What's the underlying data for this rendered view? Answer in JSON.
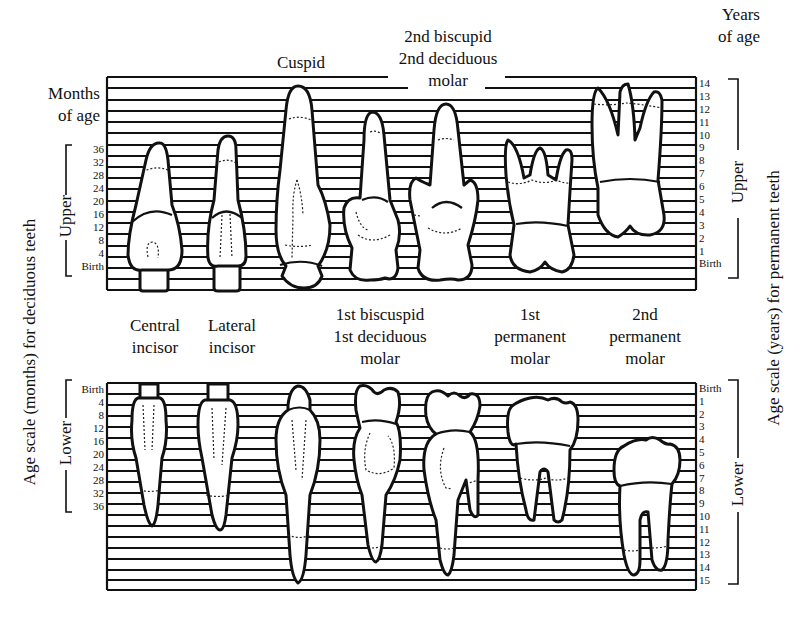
{
  "title_labels": {
    "months_of_age": [
      "Months",
      "of age"
    ],
    "years_of_age": [
      "Years",
      "of age"
    ],
    "cuspid": "Cuspid",
    "second_biscupid": [
      "2nd biscupid",
      "2nd deciduous",
      "molar"
    ],
    "central_incisor": [
      "Central",
      "incisor"
    ],
    "lateral_incisor": [
      "Lateral",
      "incisor"
    ],
    "first_biscuspid": [
      "1st biscuspid",
      "1st deciduous",
      "molar"
    ],
    "first_permanent_molar": [
      "1st",
      "permanent",
      "molar"
    ],
    "second_permanent_molar": [
      "2nd",
      "permanent",
      "molar"
    ]
  },
  "axes": {
    "left_title": "Age scale (months) for deciduous teeth",
    "right_title": "Age scale (years) for permanent teeth",
    "upper_bracket": "Upper",
    "lower_bracket": "Lower"
  },
  "upper_left_scale": [
    "36",
    "32",
    "28",
    "24",
    "20",
    "16",
    "12",
    "8",
    "4",
    "Birth"
  ],
  "lower_left_scale": [
    "Birth",
    "4",
    "8",
    "12",
    "16",
    "20",
    "24",
    "28",
    "32",
    "36"
  ],
  "upper_right_scale": [
    "14",
    "13",
    "12",
    "11",
    "10",
    "9",
    "8",
    "7",
    "6",
    "5",
    "4",
    "3",
    "2",
    "1",
    "Birth"
  ],
  "lower_right_scale": [
    "Birth",
    "1",
    "2",
    "3",
    "4",
    "5",
    "6",
    "7",
    "8",
    "9",
    "10",
    "11",
    "12",
    "13",
    "14",
    "15"
  ],
  "colors": {
    "ink": "#111111",
    "paper": "#ffffff"
  }
}
